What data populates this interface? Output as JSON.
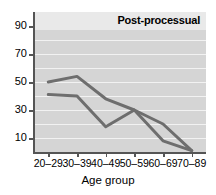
{
  "chart_data": {
    "type": "line",
    "title": "Post-processual",
    "xlabel": "Age group",
    "ylabel": "",
    "categories": [
      "20–29",
      "30–39",
      "40–49",
      "50–59",
      "60–69",
      "70–89"
    ],
    "series": [
      {
        "name": "series-upper",
        "values": [
          50,
          54,
          38,
          30,
          20,
          1
        ],
        "color": "#6e6e6e"
      },
      {
        "name": "series-lower",
        "values": [
          41,
          40,
          18,
          30,
          8,
          1
        ],
        "color": "#6e6e6e"
      }
    ],
    "ylim": [
      0,
      100
    ],
    "y_ticks": [
      10,
      30,
      50,
      70,
      90
    ],
    "y_tick_labels": [
      "10",
      "30",
      "50",
      "70",
      "90"
    ],
    "gridlines": [
      10,
      20,
      30,
      40,
      50,
      60,
      70,
      80,
      90
    ],
    "grid": true,
    "grid_color": "#f2f2f2",
    "plot_background": "#d5d5d5",
    "legend": "none",
    "axis_color": "#555555"
  }
}
